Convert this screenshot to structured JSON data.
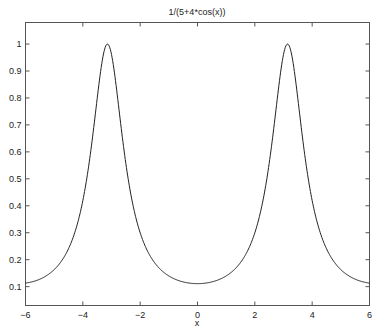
{
  "chart_data": {
    "type": "line",
    "title": "1/(5+4*cos(x))",
    "xlabel": "x",
    "ylabel": "",
    "xlim": [
      -6,
      6
    ],
    "ylim": [
      0.03,
      1.08
    ],
    "xticks": [
      -6,
      -4,
      -2,
      0,
      2,
      4,
      6
    ],
    "xtick_labels": [
      "−6",
      "−4",
      "−2",
      "0",
      "2",
      "4",
      "6"
    ],
    "yticks": [
      0.1,
      0.2,
      0.3,
      0.4,
      0.5,
      0.6,
      0.7,
      0.8,
      0.9,
      1
    ],
    "ytick_labels": [
      "0.1",
      "0.2",
      "0.3",
      "0.4",
      "0.5",
      "0.6",
      "0.7",
      "0.8",
      "0.9",
      "1"
    ],
    "grid": false,
    "legend": null,
    "series": [
      {
        "name": "1/(5+4*cos(x))",
        "function": "1/(5+4*cos(x))",
        "x": [
          -6,
          -5,
          -4.5,
          -4,
          -3.5,
          -3.1416,
          -2.8,
          -2.5,
          -2,
          -1.5,
          -1,
          -0.5,
          0,
          0.5,
          1,
          1.5,
          2,
          2.5,
          2.8,
          3.1416,
          3.5,
          4,
          4.5,
          5,
          6
        ],
        "values": [
          0.113,
          0.16,
          0.238,
          0.417,
          0.732,
          1.0,
          0.771,
          0.556,
          0.299,
          0.189,
          0.141,
          0.118,
          0.111,
          0.118,
          0.141,
          0.189,
          0.299,
          0.556,
          0.771,
          1.0,
          0.732,
          0.417,
          0.238,
          0.16,
          0.113
        ],
        "color": "#222222"
      }
    ]
  }
}
